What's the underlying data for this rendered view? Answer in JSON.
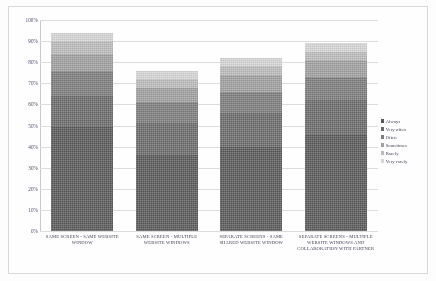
{
  "chart_data": {
    "type": "bar",
    "stacked": true,
    "title": "",
    "xlabel": "",
    "ylabel": "",
    "ylim": [
      0,
      100
    ],
    "grid": true,
    "legend_position": "right",
    "ytick_labels": [
      "100%",
      "90%",
      "80%",
      "70%",
      "60%",
      "50%",
      "40%",
      "30%",
      "20%",
      "10%",
      "0%"
    ],
    "ytick_values": [
      100,
      90,
      80,
      70,
      60,
      50,
      40,
      30,
      20,
      10,
      0
    ],
    "categories": [
      "SAME SCREEN - SAME WEBSITE WINDOW",
      "SAME SCREEN - MULTIPLE WEBSITE WINDOWS",
      "SEPARATE SCREENS - SAME SHARED WEBSITE WINDOW",
      "SEPARATE SCREENS - MULTIPLE WEBSITE WINDOWS AND COLLABORATION WITH PARTNER"
    ],
    "series": [
      {
        "name": "Always",
        "color": "#595959",
        "values": [
          50,
          36,
          40,
          46
        ]
      },
      {
        "name": "Very often",
        "color": "#6b6b6b",
        "values": [
          14,
          15,
          16,
          16
        ]
      },
      {
        "name": "Often",
        "color": "#7d7d7d",
        "values": [
          12,
          10,
          10,
          11
        ]
      },
      {
        "name": "Sometimes",
        "color": "#a0a0a0",
        "values": [
          8,
          7,
          8,
          8
        ]
      },
      {
        "name": "Rarely",
        "color": "#bcbcbc",
        "values": [
          6,
          4,
          4,
          4
        ]
      },
      {
        "name": "Very rarely",
        "color": "#d6d6d6",
        "values": [
          4,
          4,
          4,
          4
        ]
      }
    ],
    "totals": [
      94,
      76,
      82,
      89
    ]
  },
  "legend": {
    "marker": "■",
    "entries": [
      {
        "label": "Always"
      },
      {
        "label": "Very often"
      },
      {
        "label": "Often"
      },
      {
        "label": "Sometimes"
      },
      {
        "label": "Rarely"
      },
      {
        "label": "Very rarely"
      }
    ]
  }
}
